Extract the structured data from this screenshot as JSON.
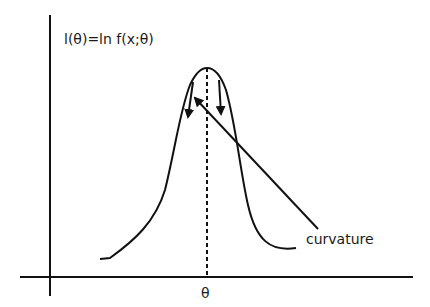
{
  "diagram": {
    "y_label": "l(θ)=ln f(x;θ)",
    "x_label": "θ",
    "annotation": "curvature",
    "colors": {
      "stroke": "#111111",
      "background": "#ffffff"
    },
    "elements": [
      "y-axis",
      "x-axis",
      "log-likelihood-curve",
      "dashed-vertical-line-at-maximum",
      "left-curvature-arrow",
      "right-curvature-arrow",
      "curvature-pointer-arrow"
    ]
  }
}
